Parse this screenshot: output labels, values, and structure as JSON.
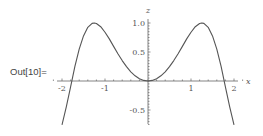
{
  "cell": {
    "output_label": "Out[10]="
  },
  "chart_data": {
    "type": "line",
    "title": "",
    "function": "sin(x^2)",
    "xlabel": "x",
    "ylabel": "z",
    "xlim": [
      -2,
      2
    ],
    "ylim": [
      -0.76,
      1.0
    ],
    "grid": false,
    "legend": null,
    "x_ticks": [
      {
        "value": -2,
        "label": "-2"
      },
      {
        "value": -1,
        "label": "-1"
      },
      {
        "value": 1,
        "label": "1"
      },
      {
        "value": 2,
        "label": "2"
      }
    ],
    "y_ticks": [
      {
        "value": 1.0,
        "label": "1.0"
      },
      {
        "value": 0.5,
        "label": "0.5"
      },
      {
        "value": -0.5,
        "label": "-0.5"
      }
    ],
    "series": [
      {
        "name": "sin(x^2)",
        "color": "#555555",
        "x": [
          -2.0,
          -1.9,
          -1.8,
          -1.7,
          -1.6,
          -1.5,
          -1.4,
          -1.3,
          -1.25,
          -1.2,
          -1.1,
          -1.0,
          -0.9,
          -0.8,
          -0.7,
          -0.6,
          -0.5,
          -0.4,
          -0.3,
          -0.2,
          -0.1,
          0.0,
          0.1,
          0.2,
          0.3,
          0.4,
          0.5,
          0.6,
          0.7,
          0.8,
          0.9,
          1.0,
          1.1,
          1.2,
          1.25,
          1.3,
          1.4,
          1.5,
          1.6,
          1.7,
          1.8,
          1.9,
          2.0
        ],
        "y": [
          -0.757,
          -0.448,
          -0.102,
          0.251,
          0.549,
          0.778,
          0.925,
          0.993,
          1.0,
          0.991,
          0.936,
          0.841,
          0.726,
          0.597,
          0.471,
          0.352,
          0.247,
          0.159,
          0.09,
          0.04,
          0.01,
          0.0,
          0.01,
          0.04,
          0.09,
          0.159,
          0.247,
          0.352,
          0.471,
          0.597,
          0.726,
          0.841,
          0.936,
          0.991,
          1.0,
          0.993,
          0.925,
          0.778,
          0.549,
          0.251,
          -0.102,
          -0.448,
          -0.757
        ]
      }
    ]
  }
}
